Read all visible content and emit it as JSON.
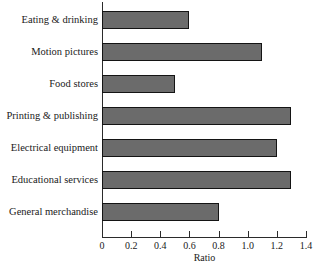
{
  "chart_data": {
    "type": "bar",
    "orientation": "horizontal",
    "title": "",
    "subtitle": "",
    "xlabel": "Ratio",
    "ylabel": "",
    "xlim": [
      0,
      1.4
    ],
    "xticks": [
      0,
      0.2,
      0.4,
      0.6,
      0.8,
      1.0,
      1.2,
      1.4
    ],
    "xtick_labels": [
      "0",
      "0.2",
      "0.4",
      "0.6",
      "0.8",
      "1.0",
      "1.2",
      "1.4"
    ],
    "grid": false,
    "legend": false,
    "legend_position": "none",
    "bar_color": "#6b6b6b",
    "bar_edge_color": "#141414",
    "categories": [
      "Eating & drinking",
      "Motion pictures",
      "Food stores",
      "Printing & publishing",
      "Electrical equipment",
      "Educational services",
      "General merchandise"
    ],
    "values": [
      0.6,
      1.1,
      0.5,
      1.3,
      1.2,
      1.3,
      0.8
    ],
    "annotations": []
  }
}
